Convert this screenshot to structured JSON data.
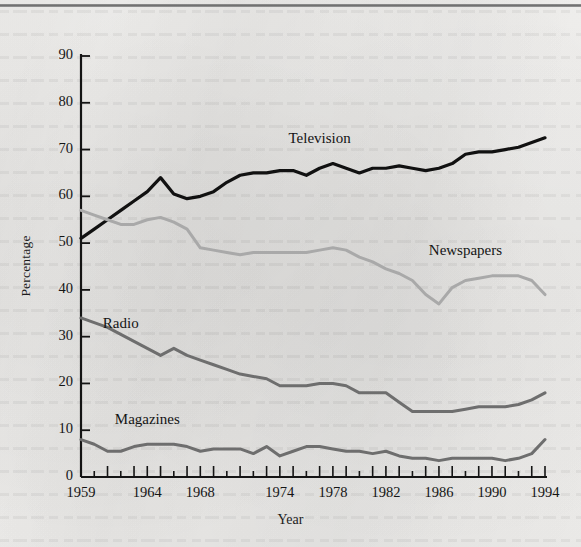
{
  "chart_data": {
    "type": "line",
    "title": "",
    "xlabel": "Year",
    "ylabel": "Percentage",
    "xlim": [
      1959,
      1994
    ],
    "ylim": [
      0,
      90
    ],
    "ytick_step": 10,
    "grid": false,
    "legend": "inline-labels",
    "yticks": [
      "0",
      "10",
      "20",
      "30",
      "40",
      "50",
      "60",
      "70",
      "80",
      "90"
    ],
    "xticks": [
      "1959",
      "1964",
      "1968",
      "1974",
      "1978",
      "1982",
      "1986",
      "1990",
      "1994"
    ],
    "x": [
      1959,
      1960,
      1961,
      1962,
      1963,
      1964,
      1965,
      1966,
      1967,
      1968,
      1969,
      1970,
      1971,
      1972,
      1973,
      1974,
      1975,
      1976,
      1977,
      1978,
      1979,
      1980,
      1981,
      1982,
      1983,
      1984,
      1985,
      1986,
      1987,
      1988,
      1989,
      1990,
      1991,
      1992,
      1993,
      1994
    ],
    "series": [
      {
        "name": "Television",
        "color": "#111111",
        "width": 3.2,
        "values": [
          51,
          53,
          55,
          57,
          59,
          61,
          64,
          60.5,
          59.5,
          60,
          61,
          63,
          64.5,
          65,
          65,
          65.5,
          65.5,
          64.5,
          66,
          67,
          66,
          65,
          66,
          66,
          66.5,
          66,
          65.5,
          66,
          67,
          69,
          69.5,
          69.5,
          70,
          70.5,
          71.5,
          72.5
        ],
        "label_x": 1977,
        "label_y": 72
      },
      {
        "name": "Newspapers",
        "color": "#a9a9a9",
        "width": 3.0,
        "values": [
          57,
          56,
          55,
          54,
          54,
          55,
          55.5,
          54.5,
          53,
          49,
          48.5,
          48,
          47.5,
          48,
          48,
          48,
          48,
          48,
          48.5,
          49,
          48.5,
          47,
          46,
          44.5,
          43.5,
          42,
          39,
          37,
          40.5,
          42,
          42.5,
          43,
          43,
          43,
          42,
          39
        ],
        "label_x": 1988,
        "label_y": 48
      },
      {
        "name": "Radio",
        "color": "#6e6e6e",
        "width": 3.0,
        "values": [
          34,
          33,
          32,
          30.5,
          29,
          27.5,
          26,
          27.5,
          26,
          25,
          24,
          23,
          22,
          21.5,
          21,
          19.5,
          19.5,
          19.5,
          20,
          20,
          19.5,
          18,
          18,
          18,
          16,
          14,
          14,
          14,
          14,
          14.5,
          15,
          15,
          15,
          15.5,
          16.5,
          18
        ],
        "label_x": 1962,
        "label_y": 32.5
      },
      {
        "name": "Magazines",
        "color": "#6e6e6e",
        "width": 3.0,
        "values": [
          8,
          7,
          5.5,
          5.5,
          6.5,
          7,
          7,
          7,
          6.5,
          5.5,
          6,
          6,
          6,
          5,
          6.5,
          4.5,
          5.5,
          6.5,
          6.5,
          6,
          5.5,
          5.5,
          5,
          5.5,
          4.5,
          4,
          4,
          3.5,
          4,
          4,
          4,
          4,
          3.5,
          4,
          5,
          8
        ],
        "label_x": 1964,
        "label_y": 12
      }
    ]
  },
  "axes": {
    "y_axis_name": "Percentage",
    "x_axis_name": "Year"
  }
}
